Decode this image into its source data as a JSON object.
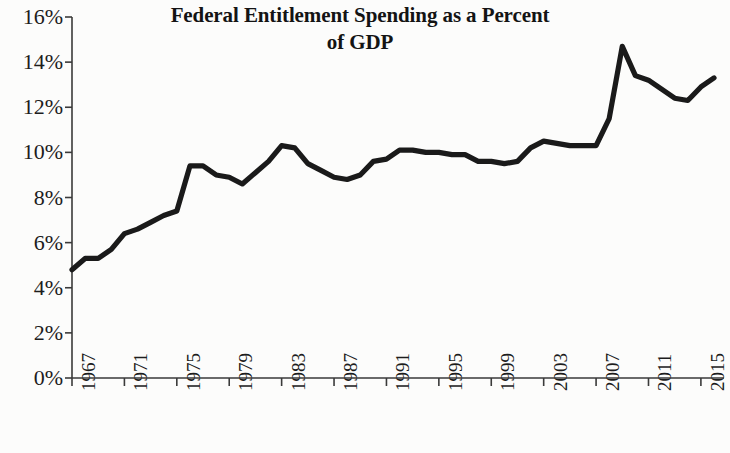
{
  "chart_data": {
    "type": "line",
    "title": "Federal Entitlement Spending as a Percent of GDP",
    "title_line1": "Federal Entitlement Spending as a Percent",
    "title_line2": "of GDP",
    "xlabel": "",
    "ylabel": "",
    "grid": false,
    "legend": "none",
    "line_color": "#1a1a1a",
    "axis_color": "#3a3a3a",
    "background_color": "#fcfcfb",
    "xlim": [
      1967,
      2016
    ],
    "ylim": [
      0,
      16
    ],
    "ytick_labels": [
      "16%",
      "14%",
      "12%",
      "10%",
      "8%",
      "6%",
      "4%",
      "2%",
      "0%"
    ],
    "ytick_values": [
      16,
      14,
      12,
      10,
      8,
      6,
      4,
      2,
      0
    ],
    "xtick_labels": [
      "1967",
      "1971",
      "1975",
      "1979",
      "1983",
      "1987",
      "1991",
      "1995",
      "1999",
      "2003",
      "2007",
      "2011",
      "2015"
    ],
    "xtick_values": [
      1967,
      1971,
      1975,
      1979,
      1983,
      1987,
      1991,
      1995,
      1999,
      2003,
      2007,
      2011,
      2015
    ],
    "x": [
      1967,
      1968,
      1969,
      1970,
      1971,
      1972,
      1973,
      1974,
      1975,
      1976,
      1977,
      1978,
      1979,
      1980,
      1981,
      1982,
      1983,
      1984,
      1985,
      1986,
      1987,
      1988,
      1989,
      1990,
      1991,
      1992,
      1993,
      1994,
      1995,
      1996,
      1997,
      1998,
      1999,
      2000,
      2001,
      2002,
      2003,
      2004,
      2005,
      2006,
      2007,
      2008,
      2009,
      2010,
      2011,
      2012,
      2013,
      2014,
      2015,
      2016
    ],
    "values": [
      4.8,
      5.3,
      5.3,
      5.7,
      6.4,
      6.6,
      6.9,
      7.2,
      7.4,
      9.4,
      9.4,
      9.0,
      8.9,
      8.6,
      9.1,
      9.6,
      10.3,
      10.2,
      9.5,
      9.2,
      8.9,
      8.8,
      9.0,
      9.6,
      9.7,
      10.1,
      10.1,
      10.0,
      10.0,
      9.9,
      9.9,
      9.6,
      9.6,
      9.5,
      9.6,
      10.2,
      10.5,
      10.4,
      10.3,
      10.3,
      10.3,
      11.5,
      14.7,
      13.4,
      13.2,
      12.8,
      12.4,
      12.3,
      12.9,
      13.3
    ],
    "series": [
      {
        "name": "Federal Entitlement Spending (% of GDP)",
        "values": [
          4.8,
          5.3,
          5.3,
          5.7,
          6.4,
          6.6,
          6.9,
          7.2,
          7.4,
          9.4,
          9.4,
          9.0,
          8.9,
          8.6,
          9.1,
          9.6,
          10.3,
          10.2,
          9.5,
          9.2,
          8.9,
          8.8,
          9.0,
          9.6,
          9.7,
          10.1,
          10.1,
          10.0,
          10.0,
          9.9,
          9.9,
          9.6,
          9.6,
          9.5,
          9.6,
          10.2,
          10.5,
          10.4,
          10.3,
          10.3,
          10.3,
          11.5,
          14.7,
          13.4,
          13.2,
          12.8,
          12.4,
          12.3,
          12.9,
          13.3
        ]
      }
    ],
    "annotations": []
  }
}
